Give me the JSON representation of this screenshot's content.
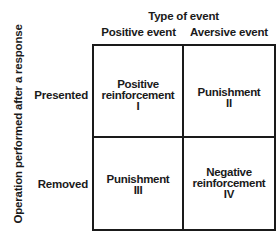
{
  "diagram": {
    "column_axis_title": "Type of event",
    "columns": [
      {
        "label": "Positive event"
      },
      {
        "label": "Aversive event"
      }
    ],
    "row_axis_title": "Operation performed after a response",
    "rows": [
      {
        "label": "Presented"
      },
      {
        "label": "Removed"
      }
    ],
    "cells": [
      {
        "lines": [
          "Positive",
          "reinforcement",
          "I"
        ]
      },
      {
        "lines": [
          "Punishment",
          "II"
        ]
      },
      {
        "lines": [
          "Punishment",
          "III"
        ]
      },
      {
        "lines": [
          "Negative",
          "reinforcement",
          "IV"
        ]
      }
    ],
    "colors": {
      "ink": "#1a1a1a",
      "background": "#ffffff"
    }
  }
}
